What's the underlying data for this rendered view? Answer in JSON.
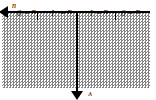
{
  "figure": {
    "name": "complex-half-plane-diagram",
    "orientation_degrees": 180,
    "colors": {
      "ink": "#000000",
      "stipple": "#7d7d7d",
      "background": "#ffffff"
    },
    "axes": {
      "horizontal": {
        "label": "u",
        "arrow_direction": "right-in-figure-frame",
        "name": "u-axis"
      },
      "vertical": {
        "label": "v",
        "arrow_direction": "up-in-figure-frame",
        "name": "v-axis"
      }
    },
    "ticks": [
      {
        "label": "u = 0",
        "x": 16,
        "value": 0
      },
      {
        "label": "u = 1",
        "x": 48,
        "value": 1
      },
      {
        "label": "u = -1",
        "x": 84,
        "value": -1
      },
      {
        "label": "u = 0",
        "x": 120,
        "value": 0
      }
    ],
    "tick_marks_x": [
      40,
      79,
      118
    ],
    "region": {
      "name": "shaded-half-plane",
      "fill": "dotted-stipple"
    }
  }
}
